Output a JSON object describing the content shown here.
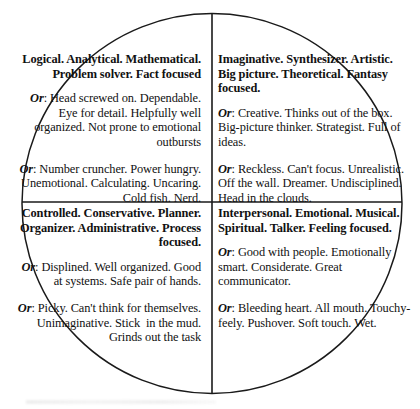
{
  "diagram": {
    "type": "quadrant-circle",
    "shape": "circle",
    "stroke_color": "#1a1a1a",
    "background_color": "#ffffff",
    "text_color": "#111111",
    "or_label": "Or",
    "or_separator": ": ",
    "quadrants": [
      {
        "position": "top-left",
        "align": "right",
        "heading": "Logical. Analytical. Mathematical. Problem solver. Fact focused",
        "or_blocks": [
          "Head screwed on. Dependable. Eye for detail. Helpfully well organized. Not prone to emotional outbursts",
          "Number cruncher. Power hungry. Unemotional. Calculating. Uncaring. Cold fish. Nerd."
        ]
      },
      {
        "position": "top-right",
        "align": "left",
        "heading": "Imaginative. Synthesizer. Artistic. Big picture. Theoretical. Fantasy focused.",
        "or_blocks": [
          "Creative. Thinks out of the box. Big-picture thinker. Strategist. Full of ideas.",
          "Reckless. Can't focus. Unrealistic. Off the wall. Dreamer. Undisciplined. Head in the clouds."
        ]
      },
      {
        "position": "bottom-left",
        "align": "right",
        "heading": "Controlled. Conservative. Planner. Organizer. Administrative. Process focused.",
        "or_blocks": [
          "Displined. Well organized. Good at systems. Safe pair of hands.",
          "Picky. Can't think for themselves. Unimaginative. Stick  in the mud. Grinds out the task"
        ]
      },
      {
        "position": "bottom-right",
        "align": "left",
        "heading": "Interpersonal. Emotional. Musical. Spiritual. Talker. Feeling focused.",
        "or_blocks": [
          "Good with people. Emotionally smart. Considerate. Great communicator.",
          "Bleeding heart. All mouth. Touchy-feely. Pushover. Soft touch. Wet."
        ]
      }
    ]
  }
}
